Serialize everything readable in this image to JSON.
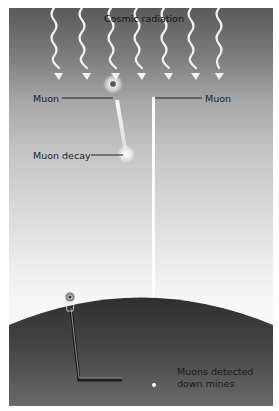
{
  "diagram": {
    "title": "Cosmic radiation",
    "labels": {
      "muon_left": "Muon",
      "muon_right": "Muon",
      "muon_decay": "Muon decay",
      "detected_line1": "Muons detected",
      "detected_line2": "down mines"
    },
    "elements": {
      "cosmic_rays_count": 7,
      "icons": [
        "wavy-arrow-icon",
        "muon-particle-icon",
        "decay-burst-icon",
        "drill-rig-icon",
        "mine-shaft",
        "earth-surface"
      ]
    },
    "colors": {
      "sky_top": "#5a5a5a",
      "sky_bottom": "#fafafa",
      "earth": "#3c3c3c",
      "rays": "#f2f2f2",
      "leader_lines": "#222222"
    }
  }
}
